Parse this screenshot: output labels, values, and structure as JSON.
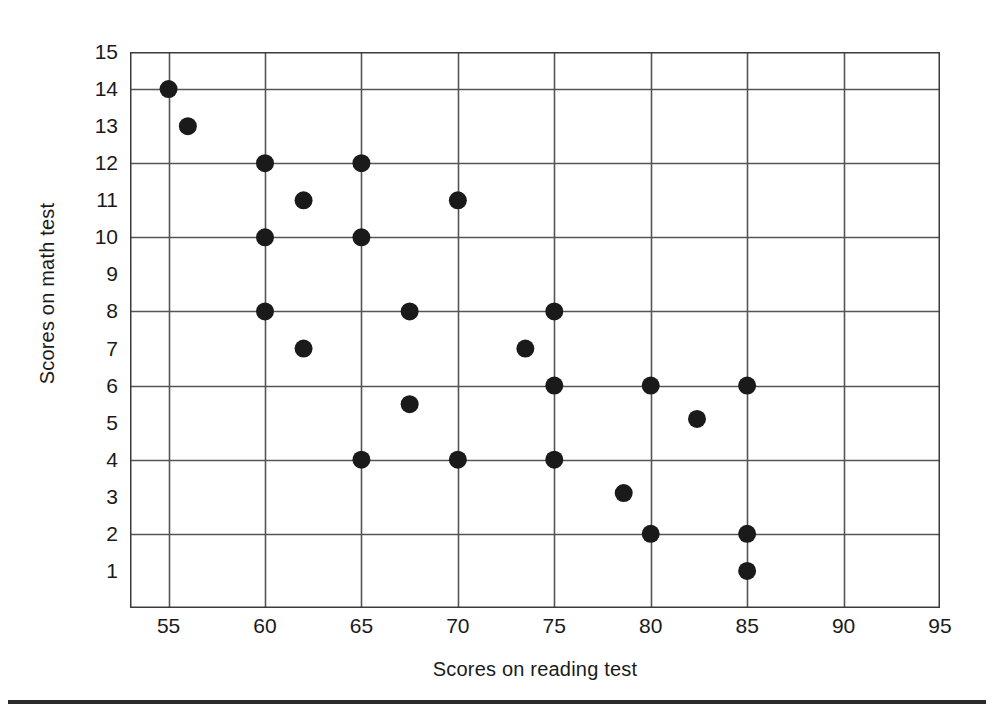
{
  "chart_data": {
    "type": "scatter",
    "title": "",
    "xlabel": "Scores on reading test",
    "ylabel": "Scores on math test",
    "xlim": [
      53,
      95
    ],
    "ylim": [
      0,
      15
    ],
    "xticks": [
      55,
      60,
      65,
      70,
      75,
      80,
      85,
      90,
      95
    ],
    "yticks": [
      1,
      2,
      3,
      4,
      5,
      6,
      7,
      8,
      9,
      10,
      11,
      12,
      13,
      14,
      15
    ],
    "grid": {
      "x_gridlines": [
        55,
        60,
        65,
        70,
        75,
        80,
        85,
        90
      ],
      "y_gridlines": [
        2,
        4,
        6,
        8,
        10,
        12,
        14
      ],
      "color": "#555555"
    },
    "legend": null,
    "marker": {
      "shape": "circle",
      "color": "#1a1a1a",
      "size_px": 9
    },
    "points": [
      {
        "x": 55,
        "y": 14
      },
      {
        "x": 56,
        "y": 13
      },
      {
        "x": 60,
        "y": 12
      },
      {
        "x": 65,
        "y": 12
      },
      {
        "x": 62,
        "y": 11
      },
      {
        "x": 70,
        "y": 11
      },
      {
        "x": 60,
        "y": 10
      },
      {
        "x": 65,
        "y": 10
      },
      {
        "x": 60,
        "y": 8
      },
      {
        "x": 67.5,
        "y": 8
      },
      {
        "x": 75,
        "y": 8
      },
      {
        "x": 62,
        "y": 7
      },
      {
        "x": 73.5,
        "y": 7
      },
      {
        "x": 75,
        "y": 6
      },
      {
        "x": 80,
        "y": 6
      },
      {
        "x": 85,
        "y": 6
      },
      {
        "x": 67.5,
        "y": 5.5
      },
      {
        "x": 82.4,
        "y": 5.1
      },
      {
        "x": 65,
        "y": 4
      },
      {
        "x": 70,
        "y": 4
      },
      {
        "x": 75,
        "y": 4
      },
      {
        "x": 78.6,
        "y": 3.1
      },
      {
        "x": 80,
        "y": 2
      },
      {
        "x": 85,
        "y": 2
      },
      {
        "x": 85,
        "y": 1
      }
    ]
  },
  "axes": {
    "border_color": "#3b3b3b",
    "background": "#ffffff"
  }
}
